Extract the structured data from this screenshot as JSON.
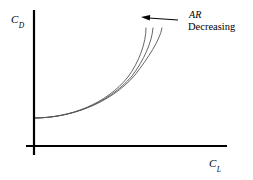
{
  "figure": {
    "type": "technical-diagram",
    "background_color": "#ffffff",
    "line_color": "#000000",
    "curve_color": "#555555",
    "axes": {
      "origin": {
        "x": 34,
        "y": 146
      },
      "y_axis": {
        "label_symbol": "C",
        "label_subscript": "D",
        "label_full": "C_D",
        "x": 34,
        "y_top": 10,
        "y_bottom": 155
      },
      "x_axis": {
        "label_symbol": "C",
        "label_subscript": "L",
        "label_full": "C_L",
        "y": 146,
        "x_left": 26,
        "x_right": 227
      }
    },
    "annotation": {
      "line1": "AR",
      "line2": "Decreasing",
      "arrow": {
        "direction": "left",
        "tail_x": 178,
        "tail_y": 20,
        "head_x": 141,
        "head_y": 17
      }
    }
  },
  "chart_data": {
    "type": "line",
    "title": "",
    "xlabel": "C_L",
    "ylabel": "C_D",
    "xlim": [
      0,
      1
    ],
    "ylim": [
      0,
      1
    ],
    "grid": false,
    "legend": "none",
    "annotations": [
      {
        "text": "AR Decreasing",
        "points_to": "fan of drag polar curves",
        "arrow_direction": "left"
      }
    ],
    "series": [
      {
        "name": "AR high",
        "path": "M 34 118 C 70 118, 110 104, 135 75 C 148 58, 160 40, 162 28",
        "x": [
          0.0,
          0.18,
          0.34,
          0.5,
          0.62,
          0.7,
          0.75
        ],
        "y": [
          0.195,
          0.196,
          0.22,
          0.3,
          0.46,
          0.64,
          0.81
        ]
      },
      {
        "name": "AR medium",
        "path": "M 34 118 C 70 118, 108 104, 132 76 C 144 60, 152 42, 153 28",
        "x": [
          0.0,
          0.18,
          0.32,
          0.48,
          0.58,
          0.63,
          0.66
        ],
        "y": [
          0.195,
          0.196,
          0.22,
          0.3,
          0.47,
          0.65,
          0.81
        ]
      },
      {
        "name": "AR low",
        "path": "M 34 118 C 70 118, 106 104, 128 77 C 139 62, 146 43, 146 28",
        "x": [
          0.0,
          0.18,
          0.3,
          0.46,
          0.54,
          0.58,
          0.6
        ],
        "y": [
          0.195,
          0.196,
          0.22,
          0.3,
          0.46,
          0.65,
          0.81
        ]
      }
    ]
  }
}
